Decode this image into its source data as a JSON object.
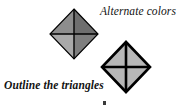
{
  "figure": {
    "background_color": "#ffffff",
    "width": 182,
    "height": 108,
    "labels": {
      "alternate_colors": "Alternate colors",
      "outline_triangles": "Outline the triangles"
    },
    "stroke_color": "#000000",
    "diamonds": [
      {
        "id": "upper-diamond",
        "name": "alternate-colors-diamond",
        "center_x": 74,
        "center_y": 34,
        "half_width": 24,
        "half_height": 25,
        "outline_width": 1.2,
        "cross_width": 1.4,
        "fills": {
          "top": "#6e6e6e",
          "right": "#7e7e7e",
          "bottom": "#a9a9a9",
          "left": "#8d8d8d"
        }
      },
      {
        "id": "lower-diamond",
        "name": "outline-triangles-diamond",
        "center_x": 126,
        "center_y": 67,
        "half_width": 24,
        "half_height": 25,
        "outline_width": 2.6,
        "cross_width": 2.6,
        "fills": {
          "top": "#b7b7b7",
          "right": "#b7b7b7",
          "bottom": "#b7b7b7",
          "left": "#b7b7b7"
        }
      }
    ],
    "artifact": {
      "name": "page-mark",
      "x": 103,
      "y": 101,
      "width": 3,
      "height": 4,
      "color": "#3a3a3a"
    }
  }
}
